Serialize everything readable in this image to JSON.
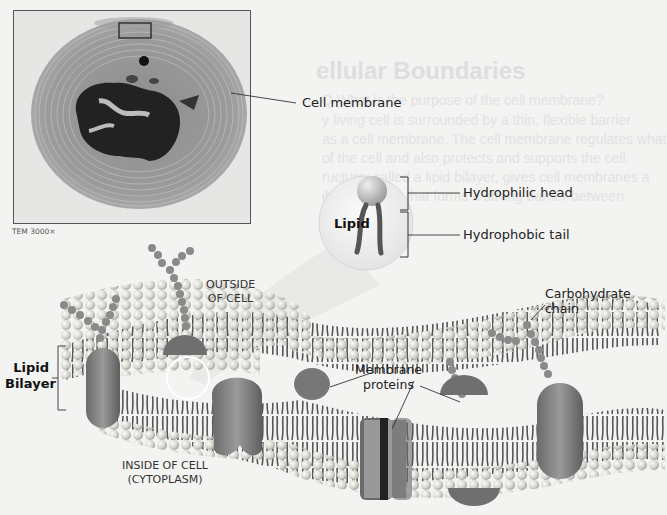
{
  "figure": {
    "micrograph": {
      "caption": "TEM 3000×",
      "structure_label": "Cell membrane"
    },
    "lipid_callout": {
      "title": "Lipid",
      "head_label": "Hydrophilic head",
      "tail_label": "Hydrophobic tail"
    },
    "membrane": {
      "bilayer_label_line1": "Lipid",
      "bilayer_label_line2": "Bilayer",
      "outside_line1": "OUTSIDE",
      "outside_line2": "OF CELL",
      "inside_line1": "INSIDE OF CELL",
      "inside_line2": "(CYTOPLASM)",
      "carbohydrate_line1": "Carbohydrate",
      "carbohydrate_line2": "chain",
      "proteins_line1": "Membrane",
      "proteins_line2": "proteins"
    },
    "background_text": {
      "heading": "ellular Boundaries",
      "lines": [
        "Q What is the purpose of the cell membrane?",
        "y living cell is surrounded by a thin, flexible barrier",
        "as a cell membrane. The cell membrane regulates what",
        "of the cell and also protects and supports the cell.",
        "ructure, called a lipid bilayer, gives cell membranes a",
        "ible structure that forms a strong barrier between"
      ]
    },
    "colors": {
      "background": "#f3f3f2",
      "lipid_head": "#d8d8d4",
      "lipid_tail": "#5a5a5a",
      "protein": "#7d7d7d",
      "carbohydrate": "#8a8a8a",
      "label_text": "#222222"
    }
  }
}
